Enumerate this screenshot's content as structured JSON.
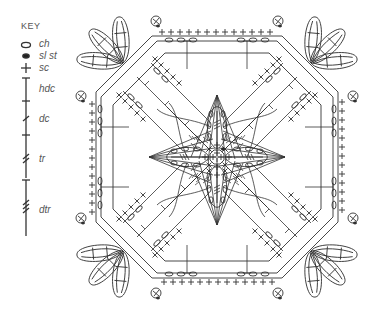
{
  "key": {
    "title": "KEY",
    "items": [
      {
        "symbol": "oval",
        "label": "ch",
        "meaning": "chain"
      },
      {
        "symbol": "dot",
        "label": "sl st",
        "meaning": "slip stitch"
      },
      {
        "symbol": "plus",
        "label": "sc",
        "meaning": "single crochet"
      },
      {
        "symbol": "post-0",
        "label": "hdc",
        "meaning": "half double crochet"
      },
      {
        "symbol": "post-1",
        "label": "dc",
        "meaning": "double crochet"
      },
      {
        "symbol": "post-2",
        "label": "tr",
        "meaning": "treble crochet"
      },
      {
        "symbol": "post-3",
        "label": "dtr",
        "meaning": "double treble crochet"
      }
    ]
  },
  "chart": {
    "type": "crochet granny-square chart",
    "center_ring": "ch ring with sl st join",
    "center_petals": 4,
    "fans": 4,
    "corner_leaf_clusters": 4,
    "leaves_per_corner": 3,
    "corner_picots": 8,
    "stroke_color": "#333333",
    "background": "#ffffff"
  }
}
